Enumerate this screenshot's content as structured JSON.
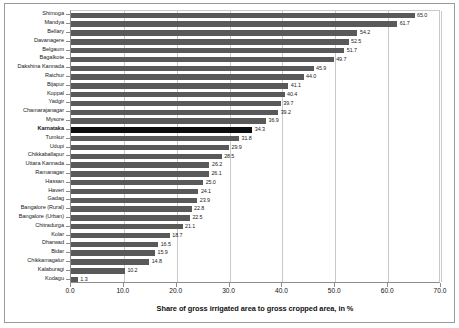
{
  "chart_data": {
    "type": "bar",
    "orientation": "horizontal",
    "title": "",
    "xlabel": "Share of gross irrigated area to gross cropped area, in %",
    "ylabel": "",
    "xlim": [
      0.0,
      70.0
    ],
    "xticks": [
      "0.0",
      "10.0",
      "20.0",
      "30.0",
      "40.0",
      "50.0",
      "60.0",
      "70.0"
    ],
    "xtick_values": [
      0,
      10,
      20,
      30,
      40,
      50,
      60,
      70
    ],
    "grid": "vertical",
    "legend": "none",
    "highlight_category": "Karnataka",
    "bar_color": "#595959",
    "highlight_color": "#0d0d0d",
    "categories": [
      "Shimoga",
      "Mandya",
      "Bellary",
      "Davanagere",
      "Belgaum",
      "Bagalkote",
      "Dakshina Kannada",
      "Raichur",
      "Bijapur",
      "Koppal",
      "Yadgir",
      "Chamarajanagar",
      "Mysore",
      "Karnataka",
      "Tumkur",
      "Udupi",
      "Chikkaballapur",
      "Uttara Kannada",
      "Ramanagar",
      "Hassan",
      "Haveri",
      "Gadag",
      "Bangalore (Rural)",
      "Bangalore (Urban)",
      "Chitradurga",
      "Kolar",
      "Dharwad",
      "Bidar",
      "Chikkamagalur",
      "Kalaburagi",
      "Kodagu"
    ],
    "values": [
      65.0,
      61.7,
      54.2,
      52.5,
      51.7,
      49.7,
      45.9,
      44.0,
      41.1,
      40.4,
      39.7,
      39.2,
      36.9,
      34.3,
      31.8,
      29.9,
      28.5,
      26.2,
      26.1,
      25.0,
      24.1,
      23.9,
      22.8,
      22.5,
      21.1,
      18.7,
      16.5,
      15.9,
      14.8,
      10.2,
      1.3
    ],
    "value_labels": [
      "65.0",
      "61.7",
      "54.2",
      "52.5",
      "51.7",
      "49.7",
      "45.9",
      "44.0",
      "41.1",
      "40.4",
      "39.7",
      "39.2",
      "36.9",
      "34.3",
      "31.8",
      "29.9",
      "28.5",
      "26.2",
      "26.1",
      "25.0",
      "24.1",
      "23.9",
      "22.8",
      "22.5",
      "21.1",
      "18.7",
      "16.5",
      "15.9",
      "14.8",
      "10.2",
      "1.3"
    ]
  }
}
